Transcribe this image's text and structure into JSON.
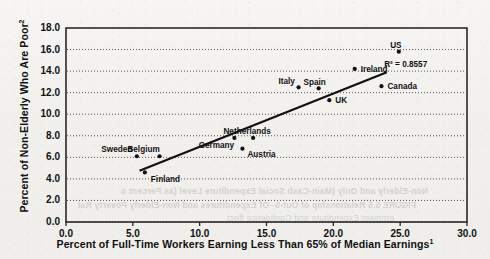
{
  "chart_data": {
    "type": "scatter",
    "title": "",
    "xlabel": "Percent of Full-Time Workers Earning Less Than 65% of Median Earnings",
    "xlabel_superscript": "1",
    "ylabel": "Percent of Non-Elderly Who Are Poor",
    "ylabel_superscript": "2",
    "xlim": [
      0.0,
      30.0
    ],
    "ylim": [
      0.0,
      18.0
    ],
    "xticks": [
      "0.0",
      "5.0",
      "10.0",
      "15.0",
      "20.0",
      "25.0",
      "30.0"
    ],
    "yticks": [
      "0.0",
      "2.0",
      "4.0",
      "6.0",
      "8.0",
      "10.0",
      "12.0",
      "14.0",
      "16.0",
      "18.0"
    ],
    "grid": "horizontal-dotted",
    "legend": "none",
    "annotation": "R² = 0.8557",
    "annotation_value": 0.8557,
    "marker_color": "#111111",
    "trendline_color": "#111111",
    "points": [
      {
        "label": "Sweden",
        "x": 5.3,
        "y": 6.1,
        "label_dx": -20,
        "label_dy": -11
      },
      {
        "label": "Finland",
        "x": 5.9,
        "y": 4.6,
        "label_dx": 6,
        "label_dy": 3
      },
      {
        "label": "Belgium",
        "x": 7.0,
        "y": 6.1,
        "label_dx": -16,
        "label_dy": -11
      },
      {
        "label": "Germany",
        "x": 12.6,
        "y": 7.8,
        "label_dx": -18,
        "label_dy": 3
      },
      {
        "label": "Austria",
        "x": 13.2,
        "y": 6.8,
        "label_dx": 5,
        "label_dy": 1
      },
      {
        "label": "Netherlands",
        "x": 14.0,
        "y": 7.8,
        "label_dx": -6,
        "label_dy": -11
      },
      {
        "label": "Italy",
        "x": 17.4,
        "y": 12.5,
        "label_dx": -12,
        "label_dy": -10
      },
      {
        "label": "Spain",
        "x": 18.9,
        "y": 12.4,
        "label_dx": -4,
        "label_dy": -10
      },
      {
        "label": "UK",
        "x": 19.7,
        "y": 11.3,
        "label_dx": 6,
        "label_dy": -4
      },
      {
        "label": "Ireland",
        "x": 21.6,
        "y": 14.2,
        "label_dx": 6,
        "label_dy": -4
      },
      {
        "label": "Canada",
        "x": 23.6,
        "y": 12.6,
        "label_dx": 6,
        "label_dy": -4
      },
      {
        "label": "US",
        "x": 24.9,
        "y": 15.8,
        "label_dx": -3,
        "label_dy": -11
      }
    ],
    "trendline": {
      "x0": 5.5,
      "y0": 4.75,
      "x1": 24.0,
      "y1": 13.9
    }
  },
  "background_bleed": [
    "Non-Elderly and Only (Main-Cash Social Expenditure Level (as Percent o",
    "FIGURE 5.5   Relationship of Out-5--Of Expenditures and Non-Elderly Poverty Rat",
    "ernment Expenditure and Confidence ffect"
  ]
}
